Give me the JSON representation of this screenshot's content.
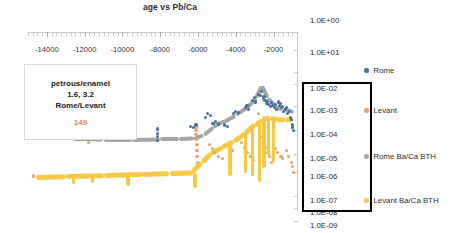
{
  "chart_data": {
    "type": "scatter",
    "title": "age vs Pb/Ca",
    "xlabel": "",
    "ylabel": "",
    "xlim": [
      -15000,
      -700
    ],
    "xticklabels": [
      "-14000",
      "-12000",
      "-10000",
      "-8000",
      "-6000",
      "-4000",
      "-2000"
    ],
    "xtickvalues": [
      -14000,
      -12000,
      -10000,
      -8000,
      -6000,
      -4000,
      -2000
    ],
    "yticklabels": [
      "1.0E+00",
      "1.0E+01",
      "1.0E-02",
      "1.0E-03",
      "1.0E-04",
      "1.0E-05",
      "1.0E-06",
      "1.0E-07",
      "1.0E-08",
      "1.0E-09"
    ],
    "grid": false,
    "legend_position": "right",
    "series": [
      {
        "name": "Rome",
        "type": "scatter",
        "color": "#44709f",
        "points": [
          [
            -8150,
            "1.3E-05"
          ],
          [
            -8150,
            "2.0E-05"
          ],
          [
            -8150,
            "3.0E-05"
          ],
          [
            -8130,
            "5.0E-05"
          ],
          [
            -6400,
            "7.0E-05"
          ],
          [
            -6250,
            "6.0E-05"
          ],
          [
            -6100,
            "8.0E-05"
          ],
          [
            -5600,
            "2.0E-04"
          ],
          [
            -5500,
            "3.0E-04"
          ],
          [
            -5350,
            "2.5E-04"
          ],
          [
            -5200,
            "1.0E-04"
          ],
          [
            -5050,
            "1.2E-04"
          ],
          [
            -4900,
            "9.0E-05"
          ],
          [
            -4600,
            "8.0E-05"
          ],
          [
            -4450,
            "7.0E-05"
          ],
          [
            -4100,
            "3.0E-04"
          ],
          [
            -4000,
            "4.0E-04"
          ],
          [
            -3850,
            "3.5E-04"
          ],
          [
            -3500,
            "6.0E-04"
          ],
          [
            -3400,
            "8.0E-04"
          ],
          [
            -3300,
            "5.0E-04"
          ],
          [
            -3100,
            "1.5E-03"
          ],
          [
            -3000,
            "2.0E-03"
          ],
          [
            -2950,
            "1.2E-03"
          ],
          [
            -2800,
            "3.0E-03"
          ],
          [
            -2700,
            "2.5E-03"
          ],
          [
            -2650,
            "4.0E-03"
          ],
          [
            -2550,
            "1.8E-03"
          ],
          [
            -2500,
            "2.2E-03"
          ],
          [
            -2450,
            "1.5E-03"
          ],
          [
            -2350,
            "1.0E-03"
          ],
          [
            -2300,
            "1.3E-03"
          ],
          [
            -2250,
            "9.0E-04"
          ],
          [
            -2150,
            "7.0E-04"
          ],
          [
            -2100,
            "1.1E-03"
          ],
          [
            -2050,
            "8.0E-04"
          ],
          [
            -1950,
            "6.0E-04"
          ],
          [
            -1900,
            "9.0E-04"
          ],
          [
            -1850,
            "5.0E-04"
          ],
          [
            -1750,
            "1.2E-03"
          ],
          [
            -1700,
            "8.0E-04"
          ],
          [
            -1650,
            "1.0E-03"
          ],
          [
            -1550,
            "6.0E-04"
          ],
          [
            -1500,
            "7.0E-04"
          ],
          [
            -1450,
            "4.0E-04"
          ],
          [
            -1350,
            "5.0E-04"
          ],
          [
            -1300,
            "6.0E-04"
          ],
          [
            -1250,
            "3.0E-04"
          ],
          [
            -1150,
            "4.0E-04"
          ],
          [
            -1100,
            "2.0E-04"
          ],
          [
            -1050,
            "1.5E-04"
          ],
          [
            -1000,
            "8.0E-05"
          ],
          [
            -980,
            "6.0E-05"
          ],
          [
            -950,
            "4.0E-05"
          ]
        ]
      },
      {
        "name": "Levant",
        "type": "scatter",
        "color": "#e8a06a",
        "points": [
          [
            -14700,
            "2.0E-07"
          ],
          [
            -11800,
            "1.0E-05"
          ],
          [
            -6100,
            "1.5E-05"
          ],
          [
            -6100,
            "2.5E-05"
          ],
          [
            -6100,
            "4.0E-05"
          ],
          [
            -6080,
            "6.0E-05"
          ],
          [
            -6050,
            "8.0E-06"
          ],
          [
            -6050,
            "4.0E-06"
          ],
          [
            -6050,
            "2.0E-06"
          ],
          [
            -6040,
            "1.0E-06"
          ],
          [
            -5400,
            "8.0E-06"
          ],
          [
            -5250,
            "5.0E-06"
          ],
          [
            -5100,
            "3.0E-06"
          ],
          [
            -4900,
            "2.0E-06"
          ],
          [
            -4700,
            "1.5E-06"
          ],
          [
            -4300,
            "6.0E-06"
          ],
          [
            -4150,
            "4.0E-06"
          ],
          [
            -3700,
            "1.0E-05"
          ],
          [
            -3550,
            "6.0E-06"
          ],
          [
            -3400,
            "3.0E-06"
          ],
          [
            -3200,
            "2.0E-06"
          ],
          [
            -3050,
            "1.2E-06"
          ],
          [
            -2800,
            "3.0E-04"
          ],
          [
            -2700,
            "2.0E-05"
          ],
          [
            -2500,
            "1.0E-05"
          ],
          [
            -2400,
            "6.0E-06"
          ],
          [
            -2300,
            "3.0E-06"
          ],
          [
            -2200,
            "2.0E-06"
          ],
          [
            -2100,
            "1.0E-06"
          ],
          [
            -1900,
            "5.0E-06"
          ],
          [
            -1800,
            "3.0E-06"
          ],
          [
            -1600,
            "2.0E-06"
          ],
          [
            -1500,
            "1.5E-06"
          ],
          [
            -1300,
            "4.0E-06"
          ],
          [
            -1200,
            "2.0E-06"
          ],
          [
            -1050,
            "1.0E-06"
          ],
          [
            -1000,
            "6.0E-07"
          ],
          [
            -950,
            "3.0E-07"
          ]
        ]
      },
      {
        "name": "Rome Ba/Ca BTH",
        "type": "line",
        "color": "#a6a6a6",
        "points": [
          [
            -12600,
            "1.5E-05"
          ],
          [
            -11000,
            "1.4E-05"
          ],
          [
            -9500,
            "1.4E-05"
          ],
          [
            -8000,
            "1.5E-05"
          ],
          [
            -7000,
            "1.5E-05"
          ],
          [
            -6200,
            "1.6E-05"
          ],
          [
            -5700,
            "2.5E-05"
          ],
          [
            -5200,
            "6.0E-05"
          ],
          [
            -4600,
            "1.2E-04"
          ],
          [
            -4000,
            "2.5E-04"
          ],
          [
            -3400,
            "6.0E-04"
          ],
          [
            -2900,
            "2.0E-03"
          ],
          [
            -2600,
            "8.0E-03"
          ],
          [
            -2300,
            "2.0E-03"
          ],
          [
            -1900,
            "7.0E-04"
          ],
          [
            -1500,
            "5.0E-04"
          ],
          [
            -1100,
            "4.0E-04"
          ],
          [
            -900,
            "3.5E-04"
          ]
        ]
      },
      {
        "name": "Levant Ba/Ca BTH",
        "type": "line",
        "color": "#f5c944",
        "points": [
          [
            -14600,
            "1.8E-07"
          ],
          [
            -13000,
            "2.0E-07"
          ],
          [
            -11000,
            "2.2E-07"
          ],
          [
            -9000,
            "2.5E-07"
          ],
          [
            -7500,
            "2.8E-07"
          ],
          [
            -6300,
            "3.0E-07"
          ],
          [
            -5800,
            "1.0E-06"
          ],
          [
            -5300,
            "3.0E-06"
          ],
          [
            -4700,
            "6.0E-06"
          ],
          [
            -4100,
            "1.2E-05"
          ],
          [
            -3500,
            "3.0E-05"
          ],
          [
            -3000,
            "8.0E-05"
          ],
          [
            -2600,
            "1.5E-04"
          ],
          [
            -2200,
            "1.8E-04"
          ],
          [
            -1800,
            "1.6E-04"
          ],
          [
            -1400,
            "1.5E-04"
          ],
          [
            -1000,
            "1.4E-04"
          ]
        ]
      }
    ]
  },
  "callout": {
    "line1": "petrous/enamel",
    "line2": "1.6, 3.2",
    "line3": "Rome/Levant",
    "number": "149",
    "number_color": "#e08a4a"
  },
  "legend": {
    "items": [
      {
        "label": "Rome",
        "color": "#44709f"
      },
      {
        "label": "Levant",
        "color": "#e8a06a"
      },
      {
        "label": "Rome Ba/Ca BTH",
        "color": "#a6a6a6"
      },
      {
        "label": "Levant Ba/Ca BTH",
        "color": "#f5c944"
      }
    ]
  },
  "highlight_box": {
    "name": "y-axis-highlight-box",
    "color": "#000000",
    "encloses": [
      "1.0E-03",
      "1.0E-04",
      "1.0E-05",
      "1.0E-06",
      "1.0E-07",
      "1.0E-08"
    ]
  }
}
